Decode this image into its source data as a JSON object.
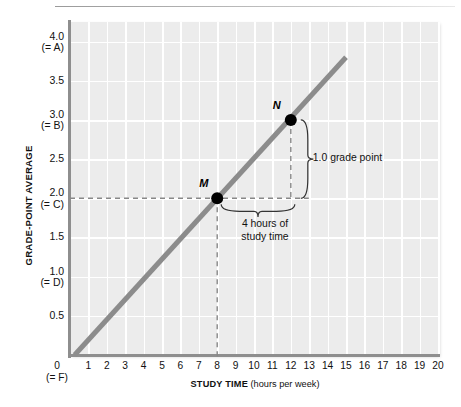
{
  "chart_data": {
    "type": "line",
    "title": "",
    "xlabel_bold": "STUDY TIME",
    "xlabel_rest": " (hours per week)",
    "ylabel": "GRADE-POINT AVERAGE",
    "xlim": [
      0,
      20
    ],
    "ylim": [
      0,
      4.25
    ],
    "grid": true,
    "legend": "none",
    "x_ticks": [
      "1",
      "2",
      "3",
      "4",
      "5",
      "6",
      "7",
      "8",
      "9",
      "10",
      "11",
      "12",
      "13",
      "14",
      "15",
      "16",
      "17",
      "18",
      "19",
      "20"
    ],
    "x_origin_label": "0",
    "x_origin_sub": "(= F)",
    "y_ticks": [
      {
        "value": "4.0",
        "sub": "(= A)"
      },
      {
        "value": "3.5",
        "sub": ""
      },
      {
        "value": "3.0",
        "sub": "(= B)"
      },
      {
        "value": "2.5",
        "sub": ""
      },
      {
        "value": "2.0",
        "sub": "(= C)"
      },
      {
        "value": "1.5",
        "sub": ""
      },
      {
        "value": "1.0",
        "sub": "(= D)"
      },
      {
        "value": "0.5",
        "sub": ""
      }
    ],
    "series": [
      {
        "name": "study time vs GPA",
        "color": "#8c8c8c",
        "x": [
          0.25,
          15.0
        ],
        "y": [
          0.0,
          3.8
        ]
      }
    ],
    "points": [
      {
        "label": "M",
        "x": 8,
        "y": 2.0
      },
      {
        "label": "N",
        "x": 12,
        "y": 3.0
      }
    ],
    "annotations": [
      {
        "name": "rise",
        "text": "1.0 grade point"
      },
      {
        "name": "run-line1",
        "text": "4 hours of"
      },
      {
        "name": "run-line2",
        "text": "study time"
      }
    ],
    "colors": {
      "plot_background": "#ececec",
      "gridline": "#ffffff",
      "axis": "#8e8e8e",
      "trendline": "#8c8c8c",
      "point": "#000000",
      "dashed_guide": "#888888",
      "text": "#111111"
    }
  }
}
